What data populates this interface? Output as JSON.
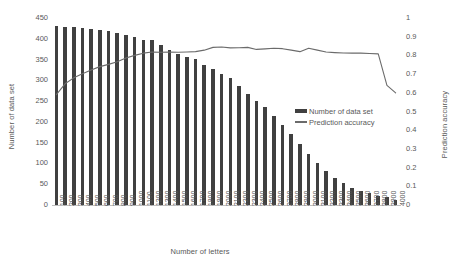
{
  "chart_data": {
    "type": "bar",
    "title": "",
    "xlabel": "Number of letters",
    "ylabel": "Number of data set",
    "y2label": "Prediction accuracy",
    "ylim": [
      0,
      450
    ],
    "y2lim": [
      0,
      1
    ],
    "grid": false,
    "legend_position": "center-right-inside",
    "y_ticks": [
      "0",
      "50",
      "100",
      "150",
      "200",
      "250",
      "300",
      "350",
      "400",
      "450"
    ],
    "y2_ticks": [
      "0",
      "0.1",
      "0.2",
      "0.3",
      "0.4",
      "0.5",
      "0.6",
      "0.7",
      "0.8",
      "0.9",
      "1"
    ],
    "categories": [
      "100",
      "200",
      "300",
      "400",
      "500",
      "600",
      "700",
      "800",
      "900",
      "1000",
      "1100",
      "1200",
      "1300",
      "1400",
      "1500",
      "1600",
      "1700",
      "1800",
      "1900",
      "2000",
      "2100",
      "2200",
      "2300",
      "2400",
      "2500",
      "2600",
      "2700",
      "2800",
      "2900",
      "3000",
      "3100",
      "3200",
      "3300",
      "3400",
      "3500",
      "3600",
      "3700",
      "3800",
      "3900",
      "4000"
    ],
    "series": [
      {
        "name": "Number of data set",
        "type": "bar",
        "axis": "left",
        "color": "#404040",
        "values": [
          430,
          428,
          428,
          427,
          424,
          422,
          418,
          414,
          408,
          404,
          397,
          396,
          385,
          374,
          363,
          356,
          351,
          338,
          327,
          316,
          305,
          287,
          266,
          250,
          235,
          215,
          193,
          170,
          146,
          122,
          100,
          82,
          65,
          52,
          42,
          34,
          28,
          22,
          19,
          12
        ]
      },
      {
        "name": "Prediction accuracy",
        "type": "line",
        "axis": "right",
        "color": "#6b6b6b",
        "values": [
          0.59,
          0.648,
          0.68,
          0.702,
          0.722,
          0.74,
          0.752,
          0.766,
          0.786,
          0.8,
          0.812,
          0.818,
          0.817,
          0.818,
          0.817,
          0.818,
          0.82,
          0.828,
          0.843,
          0.845,
          0.84,
          0.841,
          0.843,
          0.832,
          0.835,
          0.838,
          0.836,
          0.828,
          0.82,
          0.838,
          0.828,
          0.818,
          0.815,
          0.813,
          0.812,
          0.812,
          0.81,
          0.808,
          0.64,
          0.6
        ]
      }
    ],
    "legend": [
      "Number of data set",
      "Prediction accuracy"
    ]
  }
}
